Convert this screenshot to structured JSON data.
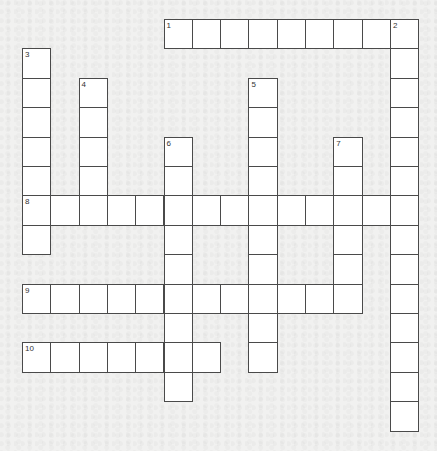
{
  "puzzle": {
    "grid_columns": 14,
    "grid_rows": 14,
    "entries": [
      {
        "number": "1",
        "direction": "across",
        "row": 0,
        "col": 5,
        "length": 9,
        "answer": ""
      },
      {
        "number": "2",
        "direction": "down",
        "row": 0,
        "col": 13,
        "length": 14,
        "answer": ""
      },
      {
        "number": "3",
        "direction": "down",
        "row": 1,
        "col": 0,
        "length": 7,
        "answer": ""
      },
      {
        "number": "4",
        "direction": "down",
        "row": 2,
        "col": 2,
        "length": 5,
        "answer": ""
      },
      {
        "number": "5",
        "direction": "down",
        "row": 2,
        "col": 8,
        "length": 10,
        "answer": ""
      },
      {
        "number": "6",
        "direction": "down",
        "row": 4,
        "col": 5,
        "length": 9,
        "answer": ""
      },
      {
        "number": "7",
        "direction": "down",
        "row": 4,
        "col": 11,
        "length": 6,
        "answer": ""
      },
      {
        "number": "8",
        "direction": "across",
        "row": 6,
        "col": 0,
        "length": 14,
        "answer": ""
      },
      {
        "number": "9",
        "direction": "across",
        "row": 9,
        "col": 0,
        "length": 12,
        "answer": ""
      },
      {
        "number": "10",
        "direction": "across",
        "row": 11,
        "col": 0,
        "length": 7,
        "answer": ""
      }
    ]
  }
}
